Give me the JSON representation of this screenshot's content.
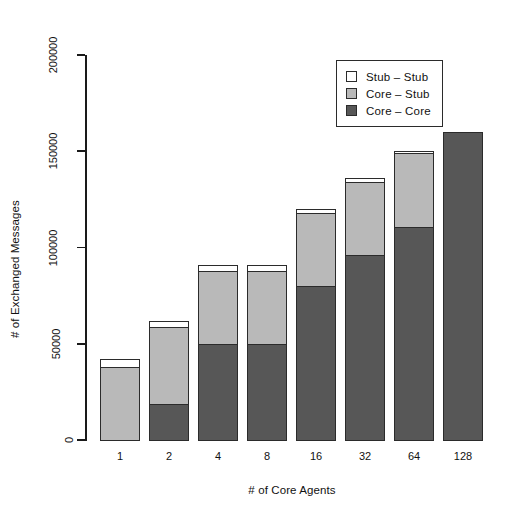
{
  "chart_data": {
    "type": "bar",
    "stacked": true,
    "title": "",
    "xlabel": "# of Core Agents",
    "ylabel": "# of Exchanged Messages",
    "categories": [
      "1",
      "2",
      "4",
      "8",
      "16",
      "32",
      "64",
      "128"
    ],
    "ylim": [
      0,
      200000
    ],
    "yticks": [
      0,
      50000,
      100000,
      150000,
      200000
    ],
    "ytick_labels": [
      "0",
      "50000",
      "100000",
      "150000",
      "200000"
    ],
    "grid": false,
    "legend_position": "top-right",
    "series": [
      {
        "name": "Core – Core",
        "color": "#575757",
        "values": [
          0,
          19000,
          50000,
          50000,
          80000,
          96000,
          111000,
          160000
        ]
      },
      {
        "name": "Core – Stub",
        "color": "#b9b9b9",
        "values": [
          38000,
          40000,
          38000,
          38000,
          38000,
          38000,
          38000,
          0
        ]
      },
      {
        "name": "Stub – Stub",
        "color": "#ffffff",
        "values": [
          4000,
          3000,
          3000,
          3000,
          2000,
          2000,
          1000,
          0
        ]
      }
    ],
    "totals": [
      42000,
      62000,
      91000,
      91000,
      120000,
      136000,
      150000,
      160000
    ],
    "legend": [
      {
        "label": "Stub – Stub",
        "color": "#ffffff"
      },
      {
        "label": "Core – Stub",
        "color": "#b9b9b9"
      },
      {
        "label": "Core – Core",
        "color": "#575757"
      }
    ]
  },
  "axes": {
    "y_title": "# of Exchanged Messages",
    "x_title": "# of Core Agents",
    "y_ticks": [
      "0",
      "50000",
      "100000",
      "150000",
      "200000"
    ],
    "x_ticks": [
      "1",
      "2",
      "4",
      "8",
      "16",
      "32",
      "64",
      "128"
    ]
  },
  "legend": {
    "items": [
      {
        "label": "Stub – Stub"
      },
      {
        "label": "Core – Stub"
      },
      {
        "label": "Core – Core"
      }
    ]
  }
}
